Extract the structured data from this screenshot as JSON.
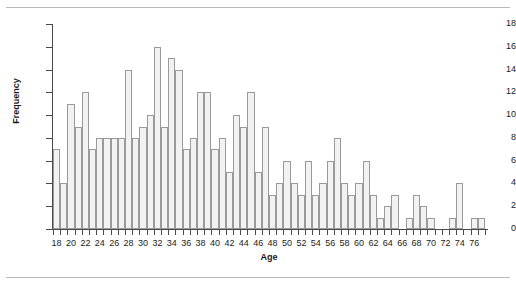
{
  "chart_data": {
    "type": "bar",
    "title": "",
    "subtitle": "",
    "xlabel": "Age",
    "ylabel": "Frequency",
    "xlim": [
      17.5,
      77.5
    ],
    "ylim": [
      0,
      18
    ],
    "grid": false,
    "legend": null,
    "y_ticks": [
      0,
      2,
      4,
      6,
      8,
      10,
      12,
      14,
      16,
      18
    ],
    "x_ticks_labeled": [
      18,
      20,
      22,
      24,
      26,
      28,
      30,
      32,
      34,
      36,
      38,
      40,
      42,
      44,
      46,
      48,
      50,
      52,
      54,
      56,
      58,
      60,
      62,
      64,
      66,
      68,
      70,
      72,
      74,
      76
    ],
    "x_tick_step_minor": 1,
    "bar_fill": "#f2f2f2",
    "bar_stroke": "#9a9a9a",
    "axis_color": "#4a4a4a",
    "text_color": "#1a1a1a",
    "background": "#ffffff",
    "categories": [
      18,
      19,
      20,
      21,
      22,
      23,
      24,
      25,
      26,
      27,
      28,
      29,
      30,
      31,
      32,
      33,
      34,
      35,
      36,
      37,
      38,
      39,
      40,
      41,
      42,
      43,
      44,
      45,
      46,
      47,
      48,
      49,
      50,
      51,
      52,
      53,
      54,
      55,
      56,
      57,
      58,
      59,
      60,
      61,
      62,
      63,
      64,
      65,
      66,
      67,
      68,
      69,
      70,
      71,
      72,
      73,
      74,
      75,
      76,
      77
    ],
    "values": [
      7,
      4,
      11,
      9,
      12,
      7,
      8,
      8,
      8,
      8,
      14,
      8,
      9,
      10,
      16,
      9,
      15,
      14,
      7,
      8,
      12,
      12,
      7,
      8,
      5,
      10,
      9,
      12,
      5,
      9,
      3,
      4,
      6,
      4,
      3,
      6,
      3,
      4,
      6,
      8,
      4,
      3,
      4,
      6,
      3,
      1,
      2,
      3,
      0,
      1,
      3,
      2,
      1,
      0,
      0,
      1,
      4,
      0,
      1,
      1
    ]
  },
  "figure": {
    "rule_top": "divider",
    "rule_bottom": "divider"
  }
}
